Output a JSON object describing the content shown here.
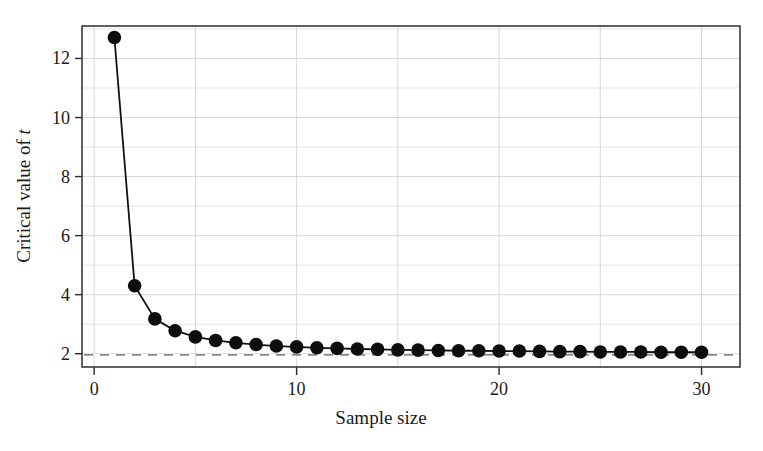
{
  "chart_data": {
    "type": "line",
    "title": "",
    "subtitle": "",
    "xlabel": "Sample size",
    "ylabel_prefix": "Critical value of ",
    "ylabel_italic": "t",
    "ylabel_full": "Critical value of t",
    "xlim": [
      -0.6,
      31.9
    ],
    "ylim": [
      1.55,
      13.1
    ],
    "xticks": [
      0,
      10,
      20,
      30
    ],
    "xtick_labels": [
      "0",
      "10",
      "20",
      "30"
    ],
    "yticks": [
      2,
      4,
      6,
      8,
      10,
      12
    ],
    "ytick_labels": [
      "2",
      "4",
      "6",
      "8",
      "10",
      "12"
    ],
    "x_minor_gridlines": [
      5,
      15,
      25
    ],
    "y_minor_gridlines": [
      3,
      5,
      7,
      9,
      11,
      13
    ],
    "grid": true,
    "legend": "none",
    "marker": "circle",
    "marker_size": 7,
    "line_color": "#111111",
    "marker_color": "#0d0d0d",
    "x": [
      1,
      2,
      3,
      4,
      5,
      6,
      7,
      8,
      9,
      10,
      11,
      12,
      13,
      14,
      15,
      16,
      17,
      18,
      19,
      20,
      21,
      22,
      23,
      24,
      25,
      26,
      27,
      28,
      29,
      30
    ],
    "values": [
      12.71,
      4.3,
      3.18,
      2.78,
      2.57,
      2.45,
      2.37,
      2.31,
      2.26,
      2.23,
      2.2,
      2.18,
      2.16,
      2.15,
      2.13,
      2.12,
      2.11,
      2.1,
      2.1,
      2.09,
      2.09,
      2.08,
      2.07,
      2.07,
      2.06,
      2.06,
      2.06,
      2.05,
      2.05,
      2.05
    ],
    "series": [
      {
        "name": "Critical value of t",
        "values": [
          12.71,
          4.3,
          3.18,
          2.78,
          2.57,
          2.45,
          2.37,
          2.31,
          2.26,
          2.23,
          2.2,
          2.18,
          2.16,
          2.15,
          2.13,
          2.12,
          2.11,
          2.1,
          2.1,
          2.09,
          2.09,
          2.08,
          2.07,
          2.07,
          2.06,
          2.06,
          2.06,
          2.05,
          2.05,
          2.05
        ]
      }
    ],
    "reference_line": {
      "name": "asymptote",
      "orientation": "horizontal",
      "y": 1.96,
      "style": "dashed",
      "color": "#8a8a8a"
    }
  }
}
